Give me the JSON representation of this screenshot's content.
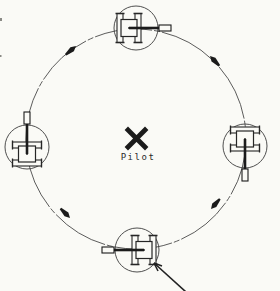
{
  "diagram": {
    "type": "formation-diagram",
    "formation": "wagon-wheel",
    "center_marker": {
      "symbol": "X",
      "label": "Pilot"
    },
    "path_circle": {
      "cx": 136,
      "cy": 139,
      "r": 110,
      "line_style": "thin phantom (dash-dot)"
    },
    "tanks": [
      {
        "id": "tank-top",
        "cx": 136,
        "cy": 28,
        "rotation": 0,
        "gun_facing": "east",
        "enclosure_radius": 22
      },
      {
        "id": "tank-right",
        "cx": 245,
        "cy": 146,
        "rotation": 90,
        "gun_facing": "south",
        "enclosure_radius": 22
      },
      {
        "id": "tank-bottom",
        "cx": 137,
        "cy": 250,
        "rotation": 180,
        "gun_facing": "west",
        "enclosure_radius": 22
      },
      {
        "id": "tank-left",
        "cx": 27,
        "cy": 147,
        "rotation": 270,
        "gun_facing": "north",
        "enclosure_radius": 22
      }
    ],
    "path_arrows": [
      {
        "id": "arrow-upper-left",
        "tip_x": 76,
        "tip_y": 46,
        "rotation": -40,
        "points": "northeast"
      },
      {
        "id": "arrow-upper-right",
        "tip_x": 210,
        "tip_y": 56,
        "rotation": -134,
        "points": "northwest"
      },
      {
        "id": "arrow-lower-right",
        "tip_x": 211,
        "tip_y": 209,
        "rotation": 131,
        "points": "southwest"
      },
      {
        "id": "arrow-lower-left",
        "tip_x": 70,
        "tip_y": 218,
        "rotation": 45,
        "points": "southeast"
      }
    ],
    "annotation_arrow": {
      "tail_x": 186,
      "tail_y": 292,
      "tip_x": 154,
      "tip_y": 263,
      "barb1_x": 158,
      "barb1_y": 271,
      "barb2_x": 162,
      "barb2_y": 266,
      "target": "tank-bottom"
    },
    "colors": {
      "paper": "#fafaf6",
      "ink": "#1b1b1b",
      "thin_line": "#4a4a4a",
      "symbol_line": "#333333"
    }
  }
}
